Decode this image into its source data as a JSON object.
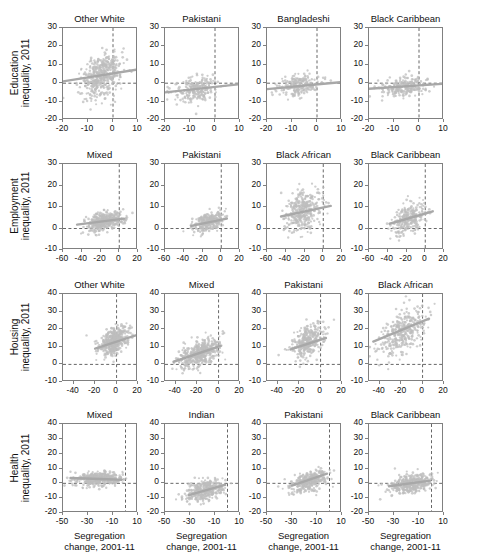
{
  "figure": {
    "width": 481,
    "height": 552,
    "point_color": "#bdbdbd",
    "trend_color": "#a8a8a8",
    "axis_color": "#808080",
    "dashed_color": "#555555",
    "shared_xlabel": "Segregation\nchange, 2001-11",
    "xlabel_line1": "Segregation",
    "xlabel_line2": "change, 2001-11"
  },
  "chart_data": {
    "type": "scatter",
    "title": "",
    "grid": false,
    "legend": "none",
    "shared_xlabel": "Segregation change, 2001-11",
    "note": "4x4 grid of scatterplots with linear trend lines; dashed reference lines at x=0 and y=0",
    "rows": [
      {
        "ylabel": "Education\ninequality, 2011",
        "ylabel_line1": "Education",
        "ylabel_line2": "inequality, 2011",
        "ylim": [
          -20,
          30
        ],
        "yticks": [
          -20,
          -10,
          0,
          10,
          20,
          30
        ],
        "xlim": [
          -20,
          10
        ],
        "xticks": [
          -20,
          -10,
          0,
          10
        ],
        "panels": [
          {
            "title": "Other White",
            "n": 430,
            "x_mean": -4.5,
            "x_sd": 4.2,
            "y_mean": 4.0,
            "y_sd": 6.0,
            "corr": 0.28,
            "trend": {
              "x1": -20,
              "y1": 1.0,
              "x2": 10,
              "y2": 7.5
            }
          },
          {
            "title": "Pakistani",
            "n": 240,
            "x_mean": -8.0,
            "x_sd": 4.0,
            "y_mean": -3.0,
            "y_sd": 3.4,
            "corr": 0.24,
            "trend": {
              "x1": -20,
              "y1": -5.0,
              "x2": 10,
              "y2": -0.5
            }
          },
          {
            "title": "Bangladeshi",
            "n": 220,
            "x_mean": -7.5,
            "x_sd": 4.5,
            "y_mean": -1.5,
            "y_sd": 3.0,
            "corr": 0.26,
            "trend": {
              "x1": -20,
              "y1": -3.2,
              "x2": 10,
              "y2": 0.6
            }
          },
          {
            "title": "Black Caribbean",
            "n": 230,
            "x_mean": -6.5,
            "x_sd": 4.8,
            "y_mean": -1.8,
            "y_sd": 2.8,
            "corr": 0.2,
            "trend": {
              "x1": -20,
              "y1": -3.0,
              "x2": 10,
              "y2": -0.3
            }
          }
        ]
      },
      {
        "ylabel": "Employment\ninequality, 2011",
        "ylabel_line1": "Employment",
        "ylabel_line2": "inequality, 2011",
        "ylim": [
          -10,
          30
        ],
        "yticks": [
          -10,
          0,
          10,
          20,
          30
        ],
        "xlim": [
          -60,
          20
        ],
        "xticks": [
          -60,
          -40,
          -20,
          0,
          20
        ],
        "panels": [
          {
            "title": "Mixed",
            "n": 420,
            "x_mean": -16.0,
            "x_sd": 9.0,
            "y_mean": 3.2,
            "y_sd": 2.2,
            "corr": 0.4,
            "trend": {
              "x1": -45,
              "y1": 1.8,
              "x2": 5,
              "y2": 4.6
            }
          },
          {
            "title": "Pakistani",
            "n": 280,
            "x_mean": -14.0,
            "x_sd": 8.0,
            "y_mean": 3.0,
            "y_sd": 2.4,
            "corr": 0.42,
            "trend": {
              "x1": -32,
              "y1": 1.2,
              "x2": 6,
              "y2": 4.6
            }
          },
          {
            "title": "Black African",
            "n": 330,
            "x_mean": -21.0,
            "x_sd": 10.0,
            "y_mean": 8.0,
            "y_sd": 5.0,
            "corr": 0.3,
            "trend": {
              "x1": -45,
              "y1": 5.6,
              "x2": 8,
              "y2": 10.5
            }
          },
          {
            "title": "Black Caribbean",
            "n": 260,
            "x_mean": -17.0,
            "x_sd": 9.0,
            "y_mean": 4.5,
            "y_sd": 3.6,
            "corr": 0.42,
            "trend": {
              "x1": -38,
              "y1": 2.2,
              "x2": 8,
              "y2": 8.0
            }
          }
        ]
      },
      {
        "ylabel": "Housing\ninequality, 2011",
        "ylabel_line1": "Housing",
        "ylabel_line2": "inequality, 2011",
        "ylim": [
          -10,
          40
        ],
        "yticks": [
          -10,
          0,
          10,
          20,
          30,
          40
        ],
        "xlim": [
          -50,
          20
        ],
        "xticks": [
          -40,
          -20,
          0,
          20
        ],
        "panels": [
          {
            "title": "Other White",
            "n": 430,
            "x_mean": -3.0,
            "x_sd": 7.0,
            "y_mean": 13.0,
            "y_sd": 4.5,
            "corr": 0.48,
            "trend": {
              "x1": -20,
              "y1": 9.0,
              "x2": 18,
              "y2": 16.5
            }
          },
          {
            "title": "Mixed",
            "n": 430,
            "x_mean": -17.0,
            "x_sd": 9.0,
            "y_mean": 6.5,
            "y_sd": 4.0,
            "corr": 0.55,
            "trend": {
              "x1": -42,
              "y1": 1.5,
              "x2": 2,
              "y2": 10.5
            }
          },
          {
            "title": "Pakistani",
            "n": 300,
            "x_mean": -12.0,
            "x_sd": 7.5,
            "y_mean": 13.0,
            "y_sd": 5.0,
            "corr": 0.45,
            "trend": {
              "x1": -28,
              "y1": 8.5,
              "x2": 5,
              "y2": 15.0
            }
          },
          {
            "title": "Black African",
            "n": 330,
            "x_mean": -19.0,
            "x_sd": 11.0,
            "y_mean": 18.0,
            "y_sd": 6.5,
            "corr": 0.5,
            "trend": {
              "x1": -46,
              "y1": 13.0,
              "x2": 6,
              "y2": 26.0
            }
          }
        ]
      },
      {
        "ylabel": "Health\ninequality, 2011",
        "ylabel_line1": "Health",
        "ylabel_line2": "inequality, 2011",
        "ylim": [
          -20,
          40
        ],
        "yticks": [
          -20,
          -10,
          0,
          10,
          20,
          30,
          40
        ],
        "xlim": [
          -50,
          10
        ],
        "xticks": [
          -50,
          -30,
          -10,
          10
        ],
        "panels": [
          {
            "title": "Mixed",
            "n": 430,
            "x_mean": -22.0,
            "x_sd": 9.0,
            "y_mean": 3.0,
            "y_sd": 2.2,
            "corr": 0.1,
            "trend": {
              "x1": -44,
              "y1": 3.6,
              "x2": -3,
              "y2": 2.4
            }
          },
          {
            "title": "Indian",
            "n": 330,
            "x_mean": -18.0,
            "x_sd": 8.0,
            "y_mean": -5.0,
            "y_sd": 3.5,
            "corr": 0.45,
            "trend": {
              "x1": -31,
              "y1": -8.0,
              "x2": -2,
              "y2": -1.0
            }
          },
          {
            "title": "Pakistani",
            "n": 330,
            "x_mean": -16.0,
            "x_sd": 7.5,
            "y_mean": 1.5,
            "y_sd": 3.8,
            "corr": 0.45,
            "trend": {
              "x1": -30,
              "y1": -1.5,
              "x2": -2,
              "y2": 6.5
            }
          },
          {
            "title": "Black Caribbean",
            "n": 400,
            "x_mean": -17.0,
            "x_sd": 8.0,
            "y_mean": -0.5,
            "y_sd": 3.2,
            "corr": 0.25,
            "trend": {
              "x1": -34,
              "y1": -2.0,
              "x2": -1,
              "y2": 1.8
            }
          }
        ]
      }
    ]
  }
}
